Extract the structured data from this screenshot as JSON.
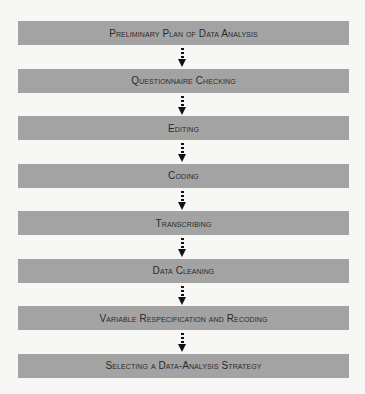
{
  "diagram": {
    "type": "flowchart",
    "direction": "top-to-bottom",
    "box_color": "#a3a3a3",
    "text_color": "#2a2a2a",
    "arrow_color": "#111111",
    "arrow_style": "dotted-with-arrowhead",
    "steps": [
      {
        "label": "Preliminary Plan of Data Analysis"
      },
      {
        "label": "Questionnaire Checking"
      },
      {
        "label": "Editing"
      },
      {
        "label": "Coding"
      },
      {
        "label": "Transcribing"
      },
      {
        "label": "Data Cleaning"
      },
      {
        "label": "Variable Respecification and Recoding"
      },
      {
        "label": "Selecting a Data-Analysis Strategy"
      }
    ]
  }
}
